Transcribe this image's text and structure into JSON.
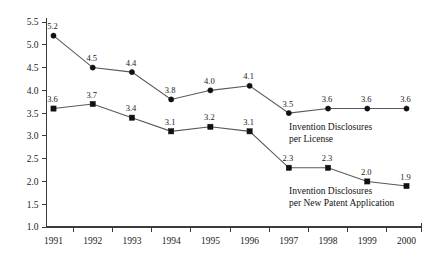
{
  "chart_data": {
    "type": "line",
    "title": "",
    "subtitle": "",
    "xlabel": "",
    "ylabel": "",
    "categories": [
      "1991",
      "1992",
      "1993",
      "1994",
      "1995",
      "1996",
      "1997",
      "1998",
      "1999",
      "2000"
    ],
    "ylim": [
      1.0,
      5.5
    ],
    "y_ticks": [
      "1.0",
      "1.5",
      "2.0",
      "2.5",
      "3.0",
      "3.5",
      "4.0",
      "4.5",
      "5.0",
      "5.5"
    ],
    "y_tick_values": [
      1.0,
      1.5,
      2.0,
      2.5,
      3.0,
      3.5,
      4.0,
      4.5,
      5.0,
      5.5
    ],
    "grid": false,
    "legend_position": "inline-annotation",
    "series": [
      {
        "name": "Invention Disclosures per License",
        "marker": "circle",
        "values": [
          5.2,
          4.5,
          4.4,
          3.8,
          4.0,
          4.1,
          3.5,
          3.6,
          3.6,
          3.6
        ],
        "labels": [
          "5.2",
          "4.5",
          "4.4",
          "3.8",
          "4.0",
          "4.1",
          "3.5",
          "3.6",
          "3.6",
          "3.6"
        ],
        "annotation_lines": [
          "Invention Disclosures",
          "per License"
        ]
      },
      {
        "name": "Invention Disclosures per New Patent Application",
        "marker": "square",
        "values": [
          3.6,
          3.7,
          3.4,
          3.1,
          3.2,
          3.1,
          2.3,
          2.3,
          2.0,
          1.9
        ],
        "labels": [
          "3.6",
          "3.7",
          "3.4",
          "3.1",
          "3.2",
          "3.1",
          "2.3",
          "2.3",
          "2.0",
          "1.9"
        ],
        "annotation_lines": [
          "Invention Disclosures",
          "per New Patent Application"
        ]
      }
    ],
    "colors": {
      "line": "#58585a",
      "marker": "#111111",
      "axis": "#3b3b3b",
      "text": "#1b1b1b",
      "background": "#ffffff"
    }
  }
}
